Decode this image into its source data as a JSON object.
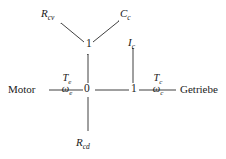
{
  "diagram": {
    "background_color": "#ffffff",
    "stroke_color": "#2b2b2b",
    "text_color": "#1a1a1a",
    "type": "bond-graph"
  },
  "terminals": {
    "source": "Motor",
    "sink": "Getriebe"
  },
  "junctions": [
    {
      "id": "j-zero",
      "label": "0"
    },
    {
      "id": "j-one-main",
      "label": "1"
    },
    {
      "id": "j-one-top",
      "label": "1"
    }
  ],
  "elements": {
    "resistor_cv": {
      "symbol": "R",
      "subscript": "cv"
    },
    "capacitor_c": {
      "symbol": "C",
      "subscript": "c"
    },
    "inertia_c": {
      "symbol": "I",
      "subscript": "c"
    },
    "resistor_cd": {
      "symbol": "R",
      "subscript": "cd"
    }
  },
  "bonds": [
    {
      "id": "bond-motor",
      "effort": {
        "symbol": "T",
        "subscript": "e"
      },
      "flow": {
        "symbol": "ω",
        "subscript": "e"
      }
    },
    {
      "id": "bond-getriebe",
      "effort": {
        "symbol": "T",
        "subscript": "c"
      },
      "flow": {
        "symbol": "ω",
        "subscript": "c"
      }
    }
  ]
}
